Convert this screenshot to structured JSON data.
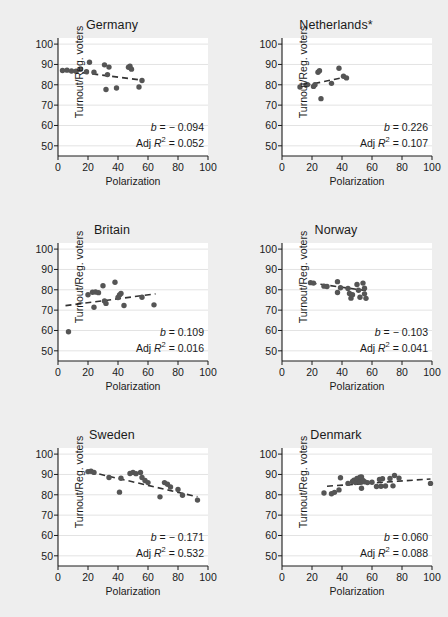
{
  "figure": {
    "background_color": "#eeeeee",
    "panel_color": "#ffffff",
    "marker_color": "#555555",
    "grid_color": "#e3e3e3",
    "axis_color": "#1a1a1a"
  },
  "chart_data": [
    {
      "type": "scatter",
      "title": "Germany",
      "xlabel": "Polarization",
      "ylabel": "Turnout/Reg. voters",
      "xlim": [
        0,
        100
      ],
      "ylim": [
        45,
        103
      ],
      "xticks": [
        0,
        20,
        40,
        60,
        80,
        100
      ],
      "yticks": [
        50,
        60,
        70,
        80,
        90,
        100
      ],
      "grid": true,
      "slope_label": "b = − 0.094",
      "r2_prefix": "Adj ",
      "r2_label": " = 0.052",
      "b": -0.094,
      "adj_r2": 0.052,
      "fit_line": {
        "x0": 3,
        "y0": 87.2,
        "x1": 57,
        "y1": 82.2,
        "style": "dashed"
      },
      "points": [
        {
          "x": 3,
          "y": 87.0
        },
        {
          "x": 6,
          "y": 87.2
        },
        {
          "x": 9,
          "y": 86.8
        },
        {
          "x": 12,
          "y": 86.7
        },
        {
          "x": 15,
          "y": 87.8
        },
        {
          "x": 19,
          "y": 86.4
        },
        {
          "x": 21,
          "y": 91.1
        },
        {
          "x": 24,
          "y": 86.2
        },
        {
          "x": 31,
          "y": 89.8
        },
        {
          "x": 32,
          "y": 77.7
        },
        {
          "x": 33,
          "y": 85.0
        },
        {
          "x": 34,
          "y": 88.7
        },
        {
          "x": 39,
          "y": 78.4
        },
        {
          "x": 47,
          "y": 88.6
        },
        {
          "x": 48,
          "y": 89.1
        },
        {
          "x": 49,
          "y": 87.7
        },
        {
          "x": 54,
          "y": 78.9
        },
        {
          "x": 56,
          "y": 82.1
        }
      ]
    },
    {
      "type": "scatter",
      "title": "Netherlands*",
      "xlabel": "Polarization",
      "ylabel": "Turnout/Reg. voters",
      "xlim": [
        0,
        100
      ],
      "ylim": [
        45,
        103
      ],
      "xticks": [
        0,
        20,
        40,
        60,
        80,
        100
      ],
      "yticks": [
        50,
        60,
        70,
        80,
        90,
        100
      ],
      "grid": true,
      "slope_label": "b = 0.226",
      "r2_prefix": "Adj ",
      "r2_label": " = 0.107",
      "b": 0.226,
      "adj_r2": 0.107,
      "fit_line": {
        "x0": 15,
        "y0": 79.6,
        "x1": 43,
        "y1": 83.9,
        "style": "dashed"
      },
      "points": [
        {
          "x": 12,
          "y": 78.9
        },
        {
          "x": 16,
          "y": 79.9
        },
        {
          "x": 17,
          "y": 80.1
        },
        {
          "x": 21,
          "y": 79.2
        },
        {
          "x": 22,
          "y": 80.0
        },
        {
          "x": 24,
          "y": 86.2
        },
        {
          "x": 25,
          "y": 86.9
        },
        {
          "x": 26,
          "y": 73.2
        },
        {
          "x": 33,
          "y": 80.7
        },
        {
          "x": 38,
          "y": 88.1
        },
        {
          "x": 41,
          "y": 84.2
        },
        {
          "x": 43,
          "y": 83.4
        }
      ]
    },
    {
      "type": "scatter",
      "title": "Britain",
      "xlabel": "Polarization",
      "ylabel": "Turnout/Reg. voters",
      "xlim": [
        0,
        100
      ],
      "ylim": [
        45,
        103
      ],
      "xticks": [
        0,
        20,
        40,
        60,
        80,
        100
      ],
      "yticks": [
        50,
        60,
        70,
        80,
        90,
        100
      ],
      "grid": true,
      "slope_label": "b = 0.109",
      "r2_prefix": "Adj ",
      "r2_label": " = 0.016",
      "b": 0.109,
      "adj_r2": 0.016,
      "fit_line": {
        "x0": 5,
        "y0": 72.2,
        "x1": 65,
        "y1": 78.0,
        "style": "dashed"
      },
      "points": [
        {
          "x": 7,
          "y": 59.4
        },
        {
          "x": 20,
          "y": 77.6
        },
        {
          "x": 23,
          "y": 78.8
        },
        {
          "x": 24,
          "y": 71.4
        },
        {
          "x": 25,
          "y": 78.9
        },
        {
          "x": 27,
          "y": 78.6
        },
        {
          "x": 30,
          "y": 82.0
        },
        {
          "x": 31,
          "y": 74.5
        },
        {
          "x": 32,
          "y": 73.3
        },
        {
          "x": 38,
          "y": 83.7
        },
        {
          "x": 40,
          "y": 76.2
        },
        {
          "x": 41,
          "y": 77.5
        },
        {
          "x": 42,
          "y": 78.2
        },
        {
          "x": 44,
          "y": 72.3
        },
        {
          "x": 56,
          "y": 76.3
        },
        {
          "x": 64,
          "y": 72.6
        }
      ]
    },
    {
      "type": "scatter",
      "title": "Norway",
      "xlabel": "Polarization",
      "ylabel": "Turnout/Reg. voters",
      "xlim": [
        0,
        100
      ],
      "ylim": [
        45,
        103
      ],
      "xticks": [
        0,
        20,
        40,
        60,
        80,
        100
      ],
      "yticks": [
        50,
        60,
        70,
        80,
        90,
        100
      ],
      "grid": true,
      "slope_label": "b = − 0.103",
      "r2_prefix": "Adj ",
      "r2_label": " = 0.041",
      "b": -0.103,
      "adj_r2": 0.041,
      "fit_line": {
        "x0": 19,
        "y0": 83.4,
        "x1": 57,
        "y1": 79.5,
        "style": "dashed"
      },
      "points": [
        {
          "x": 19,
          "y": 83.5
        },
        {
          "x": 21,
          "y": 83.3
        },
        {
          "x": 28,
          "y": 81.8
        },
        {
          "x": 30,
          "y": 81.6
        },
        {
          "x": 37,
          "y": 84.0
        },
        {
          "x": 37,
          "y": 78.7
        },
        {
          "x": 39,
          "y": 81.0
        },
        {
          "x": 44,
          "y": 80.6
        },
        {
          "x": 45,
          "y": 78.2
        },
        {
          "x": 46,
          "y": 75.9
        },
        {
          "x": 47,
          "y": 77.6
        },
        {
          "x": 50,
          "y": 82.6
        },
        {
          "x": 51,
          "y": 79.8
        },
        {
          "x": 52,
          "y": 76.3
        },
        {
          "x": 54,
          "y": 83.3
        },
        {
          "x": 55,
          "y": 80.8
        },
        {
          "x": 55,
          "y": 78.0
        },
        {
          "x": 56,
          "y": 75.8
        }
      ]
    },
    {
      "type": "scatter",
      "title": "Sweden",
      "xlabel": "Polarization",
      "ylabel": "Turnout/Reg. voters",
      "xlim": [
        0,
        100
      ],
      "ylim": [
        45,
        103
      ],
      "xticks": [
        0,
        20,
        40,
        60,
        80,
        100
      ],
      "yticks": [
        50,
        60,
        70,
        80,
        90,
        100
      ],
      "grid": true,
      "slope_label": "b = − 0.171",
      "r2_prefix": "Adj ",
      "r2_label": " = 0.532",
      "b": -0.171,
      "adj_r2": 0.532,
      "fit_line": {
        "x0": 21,
        "y0": 91.3,
        "x1": 93,
        "y1": 79.0,
        "style": "dashed"
      },
      "points": [
        {
          "x": 20,
          "y": 91.4
        },
        {
          "x": 22,
          "y": 91.6
        },
        {
          "x": 24,
          "y": 91.0
        },
        {
          "x": 34,
          "y": 88.5
        },
        {
          "x": 41,
          "y": 81.3
        },
        {
          "x": 42,
          "y": 88.1
        },
        {
          "x": 48,
          "y": 90.5
        },
        {
          "x": 50,
          "y": 91.0
        },
        {
          "x": 52,
          "y": 90.4
        },
        {
          "x": 55,
          "y": 91.0
        },
        {
          "x": 56,
          "y": 88.5
        },
        {
          "x": 58,
          "y": 87.0
        },
        {
          "x": 60,
          "y": 86.0
        },
        {
          "x": 68,
          "y": 79.0
        },
        {
          "x": 71,
          "y": 86.0
        },
        {
          "x": 73,
          "y": 85.2
        },
        {
          "x": 75,
          "y": 83.8
        },
        {
          "x": 80,
          "y": 82.6
        },
        {
          "x": 83,
          "y": 79.8
        },
        {
          "x": 93,
          "y": 77.4
        }
      ]
    },
    {
      "type": "scatter",
      "title": "Denmark",
      "xlabel": "Polarization",
      "ylabel": "Turnout/Reg. voters",
      "xlim": [
        0,
        100
      ],
      "ylim": [
        45,
        103
      ],
      "xticks": [
        0,
        20,
        40,
        60,
        80,
        100
      ],
      "yticks": [
        50,
        60,
        70,
        80,
        90,
        100
      ],
      "grid": true,
      "slope_label": "b = 0.060",
      "r2_prefix": "Adj ",
      "r2_label": " = 0.088",
      "b": 0.06,
      "adj_r2": 0.088,
      "fit_line": {
        "x0": 30,
        "y0": 84.2,
        "x1": 99,
        "y1": 87.8,
        "style": "dashed"
      },
      "points": [
        {
          "x": 28,
          "y": 80.9
        },
        {
          "x": 33,
          "y": 80.5
        },
        {
          "x": 35,
          "y": 81.2
        },
        {
          "x": 38,
          "y": 82.4
        },
        {
          "x": 39,
          "y": 88.4
        },
        {
          "x": 44,
          "y": 85.6
        },
        {
          "x": 47,
          "y": 86.5
        },
        {
          "x": 48,
          "y": 87.2
        },
        {
          "x": 49,
          "y": 86.0
        },
        {
          "x": 50,
          "y": 88.0
        },
        {
          "x": 51,
          "y": 87.5
        },
        {
          "x": 52,
          "y": 88.6
        },
        {
          "x": 52,
          "y": 86.2
        },
        {
          "x": 53,
          "y": 88.8
        },
        {
          "x": 53,
          "y": 83.2
        },
        {
          "x": 54,
          "y": 87.0
        },
        {
          "x": 55,
          "y": 86.4
        },
        {
          "x": 57,
          "y": 86.0
        },
        {
          "x": 60,
          "y": 86.2
        },
        {
          "x": 63,
          "y": 84.1
        },
        {
          "x": 65,
          "y": 87.5
        },
        {
          "x": 66,
          "y": 84.2
        },
        {
          "x": 67,
          "y": 87.9
        },
        {
          "x": 69,
          "y": 84.3
        },
        {
          "x": 72,
          "y": 88.0
        },
        {
          "x": 74,
          "y": 84.4
        },
        {
          "x": 75,
          "y": 89.5
        },
        {
          "x": 78,
          "y": 88.2
        },
        {
          "x": 99,
          "y": 85.6
        }
      ]
    }
  ]
}
